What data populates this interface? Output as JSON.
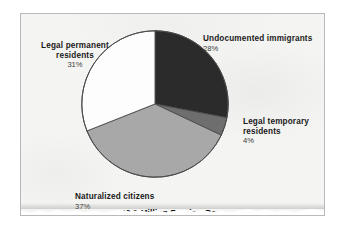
{
  "chart_data": {
    "type": "pie",
    "title": "",
    "caption": "40.2 Million Foreign-Born",
    "total_label": "40.2 Million Foreign-Born",
    "legend_position": "outside-labels",
    "start_angle_deg": 0,
    "direction": "clockwise",
    "categories": [
      "Undocumented immigrants",
      "Legal temporary residents",
      "Naturalized citizens",
      "Legal permanent residents"
    ],
    "values": [
      28,
      4,
      37,
      31
    ],
    "value_labels": [
      "28%",
      "4%",
      "37%",
      "4%"
    ],
    "units": "percent",
    "slices": [
      {
        "label": "Undocumented immigrants",
        "value": 28,
        "value_label": "28%",
        "color": "#2b2b2b",
        "start_deg": 0,
        "end_deg": 100.8
      },
      {
        "label": "Legal temporary residents",
        "value": 4,
        "value_label": "4%",
        "color": "#6e6e6e",
        "start_deg": 100.8,
        "end_deg": 115.2
      },
      {
        "label": "Naturalized citizens",
        "value": 37,
        "value_label": "37%",
        "color": "#a8a8a8",
        "start_deg": 115.2,
        "end_deg": 248.4
      },
      {
        "label": "Legal permanent residents",
        "value": 31,
        "value_label": "31%",
        "color": "#fdfdfd",
        "start_deg": 248.4,
        "end_deg": 360
      }
    ]
  },
  "labels": {
    "undocumented": {
      "category": "Undocumented immigrants",
      "percent": "28%"
    },
    "legal_temporary": {
      "category_line1": "Legal temporary",
      "category_line2": "residents",
      "percent": "4%"
    },
    "naturalized": {
      "category": "Naturalized citizens",
      "percent": "37%"
    },
    "legal_permanent": {
      "category_line1": "Legal permanent",
      "category_line2": "residents",
      "percent": "31%"
    }
  },
  "caption": "40.2 Million Foreign-Born",
  "colors": {
    "slice_undocumented": "#2b2b2b",
    "slice_legal_temporary": "#6e6e6e",
    "slice_naturalized": "#a8a8a8",
    "slice_legal_permanent": "#fdfdfd",
    "slice_outline": "#4a4a4a",
    "page_background": "#f4f4f2",
    "page_border": "#b9b9b9",
    "text": "#1a1a1a"
  }
}
